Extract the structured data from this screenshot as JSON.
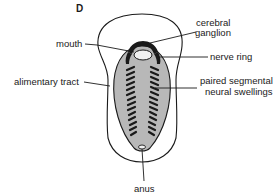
{
  "figure": {
    "panel_label": "D",
    "colors": {
      "line": "#1a1a1a",
      "body_fill": "#b8b8b8",
      "background": "#ffffff"
    },
    "labels": {
      "cerebral_ganglion_line1": "cerebral",
      "cerebral_ganglion_line2": "ganglion",
      "mouth": "mouth",
      "nerve_ring": "nerve ring",
      "alimentary_tract": "alimentary tract",
      "paired_segmental_line1": "paired segmental",
      "paired_segmental_line2": "neural swellings",
      "anus": "anus"
    }
  }
}
